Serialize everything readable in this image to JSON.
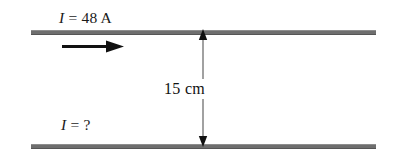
{
  "figure": {
    "type": "physics-diagram",
    "background_color": "#ffffff",
    "line_color": "#6e6e6e",
    "text_color": "#111111"
  },
  "labels": {
    "top_current_symbol": "I",
    "top_current_equals": " = ",
    "top_current_value": "48 A",
    "bottom_current_symbol": "I",
    "bottom_current_equals": " = ",
    "bottom_current_value": "?",
    "separation": "15 cm"
  },
  "conductors": [
    {
      "name": "top-wire",
      "current": "48 A",
      "direction": "right"
    },
    {
      "name": "bottom-wire",
      "current": "?",
      "direction": "unknown"
    }
  ],
  "dimension": {
    "label": "15 cm",
    "value": 15,
    "unit": "cm",
    "arrow_style": "double-headed",
    "orientation": "vertical"
  },
  "icons": {
    "current_direction": "right-arrow-icon",
    "dimension": "double-headed-vertical-arrow-icon"
  }
}
